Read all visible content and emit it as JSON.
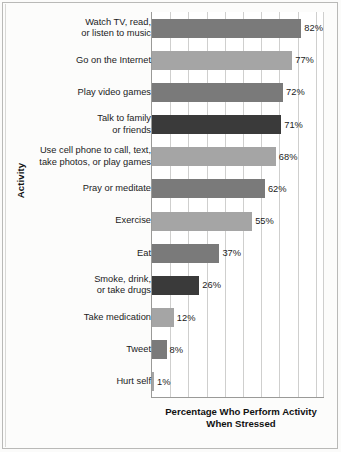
{
  "figure": {
    "y_axis_title": "Activity",
    "x_axis_title_line1": "Percentage Who Perform Activity",
    "x_axis_title_line2": "When Stressed"
  },
  "chart_data": {
    "type": "bar",
    "orientation": "horizontal",
    "title": "",
    "subtitle": "",
    "xlabel": "Percentage Who Perform Activity When Stressed",
    "ylabel": "Activity",
    "xlim": [
      0,
      95
    ],
    "grid": true,
    "gridline_interval": 10,
    "legend": null,
    "value_suffix": "%",
    "categories": [
      "Watch TV, read,\nor listen to music",
      "Go on the Internet",
      "Play video games",
      "Talk to family\nor friends",
      "Use cell phone to call, text,\ntake photos, or play games",
      "Pray or meditate",
      "Exercise",
      "Eat",
      "Smoke, drink,\nor take drugs",
      "Take medication",
      "Tweet",
      "Hurt self"
    ],
    "values": [
      82,
      77,
      72,
      71,
      68,
      62,
      55,
      37,
      26,
      12,
      8,
      1
    ],
    "value_labels": [
      "82%",
      "77%",
      "72%",
      "71%",
      "68%",
      "62%",
      "55%",
      "37%",
      "26%",
      "12%",
      "8%",
      "1%"
    ],
    "bar_colors": [
      "#7a7a7a",
      "#a5a5a5",
      "#7a7a7a",
      "#3a3a3a",
      "#a5a5a5",
      "#7a7a7a",
      "#a5a5a5",
      "#7a7a7a",
      "#3a3a3a",
      "#a5a5a5",
      "#7a7a7a",
      "#a5a5a5"
    ],
    "rows": [
      {
        "label_line1": "Watch TV, read,",
        "label_line2": "or listen to music",
        "value": 82,
        "value_label": "82%",
        "color": "#7a7a7a"
      },
      {
        "label_line1": "Go on the Internet",
        "label_line2": "",
        "value": 77,
        "value_label": "77%",
        "color": "#a5a5a5"
      },
      {
        "label_line1": "Play video games",
        "label_line2": "",
        "value": 72,
        "value_label": "72%",
        "color": "#7a7a7a"
      },
      {
        "label_line1": "Talk to family",
        "label_line2": "or friends",
        "value": 71,
        "value_label": "71%",
        "color": "#3a3a3a"
      },
      {
        "label_line1": "Use cell phone to call, text,",
        "label_line2": "take photos, or play games",
        "value": 68,
        "value_label": "68%",
        "color": "#a5a5a5"
      },
      {
        "label_line1": "Pray or meditate",
        "label_line2": "",
        "value": 62,
        "value_label": "62%",
        "color": "#7a7a7a"
      },
      {
        "label_line1": "Exercise",
        "label_line2": "",
        "value": 55,
        "value_label": "55%",
        "color": "#a5a5a5"
      },
      {
        "label_line1": "Eat",
        "label_line2": "",
        "value": 37,
        "value_label": "37%",
        "color": "#7a7a7a"
      },
      {
        "label_line1": "Smoke, drink,",
        "label_line2": "or take drugs",
        "value": 26,
        "value_label": "26%",
        "color": "#3a3a3a"
      },
      {
        "label_line1": "Take medication",
        "label_line2": "",
        "value": 12,
        "value_label": "12%",
        "color": "#a5a5a5"
      },
      {
        "label_line1": "Tweet",
        "label_line2": "",
        "value": 8,
        "value_label": "8%",
        "color": "#7a7a7a"
      },
      {
        "label_line1": "Hurt self",
        "label_line2": "",
        "value": 1,
        "value_label": "1%",
        "color": "#a5a5a5"
      }
    ]
  }
}
